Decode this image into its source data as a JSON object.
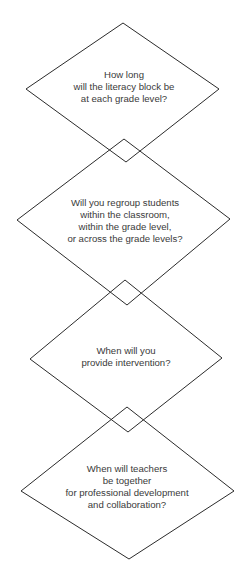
{
  "diagram": {
    "stroke_color": "#2b2b2b",
    "text_color": "#3a3a3a",
    "nodes": [
      {
        "shape": "diamond",
        "lines": [
          "How long",
          "will the literacy block be",
          "at each grade level?"
        ]
      },
      {
        "shape": "diamond",
        "lines": [
          "Will you regroup students",
          "within the classroom,",
          "within the grade level,",
          "or across the grade levels?"
        ]
      },
      {
        "shape": "diamond",
        "lines": [
          "When will you",
          "provide intervention?"
        ]
      },
      {
        "shape": "diamond",
        "lines": [
          "When will teachers",
          "be together",
          "for professional development",
          "and collaboration?"
        ]
      }
    ]
  }
}
